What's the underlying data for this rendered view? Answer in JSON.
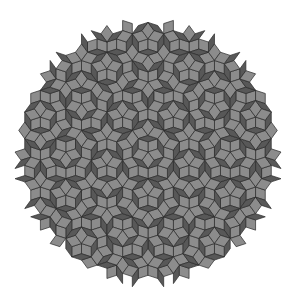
{
  "image": {
    "title": "Penrose rhombus tiling",
    "description": "Circular patch of a Penrose P3 tiling composed of fat and thin rhombi",
    "width": 295,
    "height": 307
  },
  "tiling": {
    "type": "penrose-p3",
    "center": [
      148,
      152
    ],
    "radius": 128,
    "edge_length": 10.2,
    "colors": {
      "background": "#ffffff",
      "fat_rhombus": "#8c8c8c",
      "thin_rhombus": "#585858",
      "edge": "#2a2a2a"
    }
  }
}
